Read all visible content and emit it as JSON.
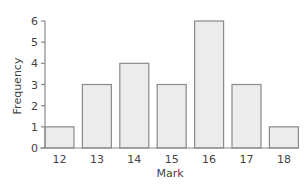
{
  "chart_data": {
    "type": "bar",
    "title": "",
    "xlabel": "Mark",
    "ylabel": "Frequency",
    "categories": [
      "12",
      "13",
      "14",
      "15",
      "16",
      "17",
      "18"
    ],
    "values": [
      1,
      3,
      4,
      3,
      6,
      3,
      1
    ],
    "yticks": [
      0,
      1,
      2,
      3,
      4,
      5,
      6
    ],
    "ylim": [
      0,
      6
    ],
    "grid": false,
    "legend": null,
    "colors": {
      "bar_fill": "#ececec",
      "bar_stroke": "#8a8a8a",
      "axis": "#8a8a8a"
    }
  }
}
